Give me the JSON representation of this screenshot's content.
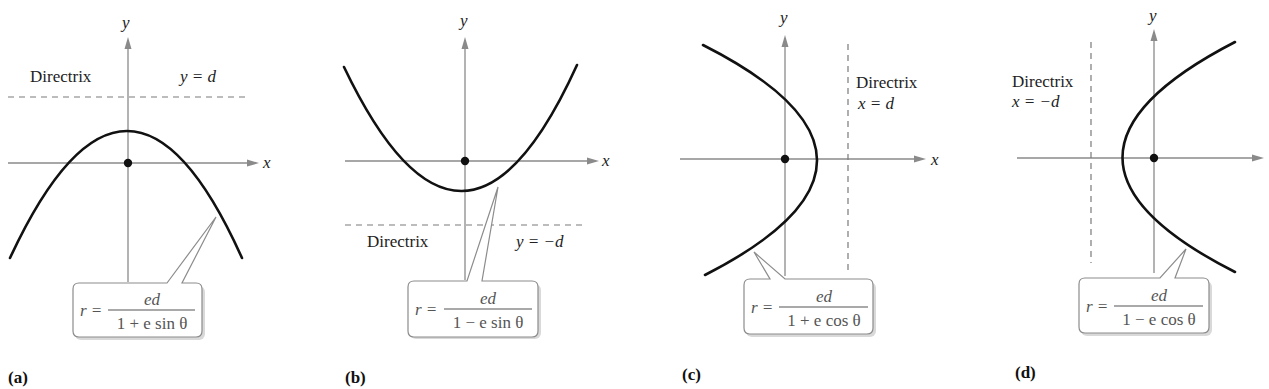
{
  "figure": {
    "panels": [
      {
        "id": "a",
        "label": "(a)",
        "axis_x_label": "x",
        "axis_y_label": "y",
        "directrix_label": "Directrix",
        "directrix_equation": "y = d",
        "directrix_orientation": "horizontal-above",
        "opens": "down",
        "formula": {
          "lhs": "r =",
          "numerator": "ed",
          "denominator": "1 + e sin θ"
        }
      },
      {
        "id": "b",
        "label": "(b)",
        "axis_x_label": "x",
        "axis_y_label": "y",
        "directrix_label": "Directrix",
        "directrix_equation": "y = −d",
        "directrix_orientation": "horizontal-below",
        "opens": "up",
        "formula": {
          "lhs": "r =",
          "numerator": "ed",
          "denominator": "1 − e sin θ"
        }
      },
      {
        "id": "c",
        "label": "(c)",
        "axis_x_label": "x",
        "axis_y_label": "y",
        "directrix_label": "Directrix",
        "directrix_equation": "x = d",
        "directrix_orientation": "vertical-right",
        "opens": "left",
        "formula": {
          "lhs": "r =",
          "numerator": "ed",
          "denominator": "1 + e cos θ"
        }
      },
      {
        "id": "d",
        "label": "(d)",
        "axis_x_label": "x",
        "axis_y_label": "y",
        "directrix_label": "Directrix",
        "directrix_equation": "x = −d",
        "directrix_orientation": "vertical-left",
        "opens": "right",
        "formula": {
          "lhs": "r =",
          "numerator": "ed",
          "denominator": "1 − e cos θ"
        }
      }
    ],
    "colors": {
      "axis": "#8a8a8a",
      "curve": "#111111",
      "directrix": "#7a7a7a",
      "callout_border": "#8c8c8c",
      "formula_text": "#555555"
    }
  }
}
